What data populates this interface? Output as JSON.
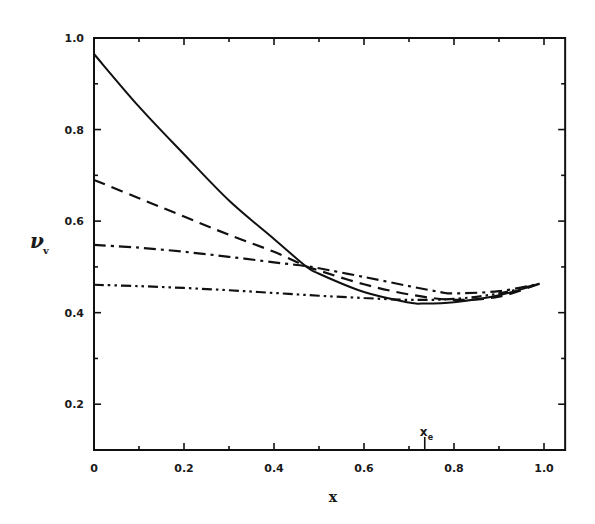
{
  "chart_data": {
    "type": "line",
    "title": "",
    "xlabel": "x",
    "ylabel": "ν_v",
    "xlim": [
      0,
      1.047
    ],
    "ylim": [
      0.1,
      1.0
    ],
    "grid": false,
    "legend": null,
    "x_ticks": [
      0,
      0.2,
      0.4,
      0.6,
      0.8,
      1.0
    ],
    "x_tick_labels": [
      "0",
      "0.2",
      "0.4",
      "0.6",
      "0.8",
      "1.0"
    ],
    "y_ticks": [
      0.2,
      0.4,
      0.6,
      0.8,
      1.0
    ],
    "y_tick_labels": [
      "0.2",
      "0.4",
      "0.6",
      "0.8",
      "1.0"
    ],
    "annotations": [
      {
        "text": "x_e",
        "x": 0.735,
        "position": "above x-axis with tick mark"
      }
    ],
    "series": [
      {
        "name": "solid",
        "style": "solid",
        "x": [
          0.0,
          0.1,
          0.2,
          0.3,
          0.4,
          0.47,
          0.5,
          0.6,
          0.7,
          0.73,
          0.8,
          0.9,
          0.99
        ],
        "y": [
          0.965,
          0.85,
          0.746,
          0.645,
          0.561,
          0.502,
          0.485,
          0.445,
          0.422,
          0.42,
          0.423,
          0.438,
          0.463
        ]
      },
      {
        "name": "dashed",
        "style": "dashed",
        "x": [
          0.0,
          0.1,
          0.2,
          0.3,
          0.4,
          0.47,
          0.5,
          0.6,
          0.7,
          0.8,
          0.9,
          0.99
        ],
        "y": [
          0.69,
          0.65,
          0.61,
          0.57,
          0.533,
          0.502,
          0.492,
          0.462,
          0.44,
          0.428,
          0.435,
          0.463
        ]
      },
      {
        "name": "dash-dot",
        "style": "dashdot",
        "x": [
          0.0,
          0.1,
          0.2,
          0.3,
          0.4,
          0.47,
          0.5,
          0.6,
          0.7,
          0.77,
          0.8,
          0.9,
          0.99
        ],
        "y": [
          0.548,
          0.542,
          0.533,
          0.522,
          0.51,
          0.502,
          0.497,
          0.478,
          0.458,
          0.445,
          0.442,
          0.447,
          0.463
        ]
      },
      {
        "name": "dash-dot-dot",
        "style": "dashdotdot",
        "x": [
          0.0,
          0.1,
          0.2,
          0.3,
          0.4,
          0.5,
          0.6,
          0.7,
          0.8,
          0.9,
          0.99
        ],
        "y": [
          0.461,
          0.458,
          0.454,
          0.449,
          0.443,
          0.437,
          0.432,
          0.428,
          0.43,
          0.442,
          0.463
        ]
      }
    ]
  }
}
